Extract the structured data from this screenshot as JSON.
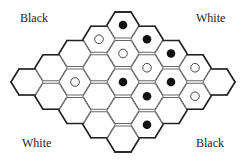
{
  "labels": {
    "top_left": "Black",
    "top_right": "White",
    "bottom_left": "White",
    "bottom_right": "Black"
  },
  "board": {
    "size": 5,
    "shape": "rhombus of flat-topped hexagons",
    "colors": {
      "line": "#555555",
      "border": "#222222",
      "black_stone": "#111111",
      "white_stone": "#ffffff"
    },
    "origin": [
      123,
      25
    ],
    "step_i": [
      -24,
      14.25
    ],
    "step_j": [
      24,
      14.25
    ],
    "cells": [
      [
        "black",
        "black",
        "black",
        "white",
        "empty"
      ],
      [
        "white",
        "white",
        "white",
        "black",
        "white"
      ],
      [
        "empty",
        "empty",
        "black",
        "black",
        "empty"
      ],
      [
        "empty",
        "white",
        "empty",
        "empty",
        "black"
      ],
      [
        "empty",
        "empty",
        "empty",
        "empty",
        "empty"
      ]
    ]
  }
}
